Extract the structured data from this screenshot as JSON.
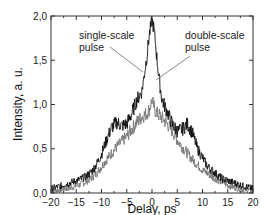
{
  "chart_data": {
    "type": "line",
    "title": "",
    "xlabel": "Delay, ps",
    "ylabel": "Intensity, a. u.",
    "xlim": [
      -20,
      20
    ],
    "ylim": [
      0,
      2.0
    ],
    "grid": false,
    "legend": null,
    "x_ticks": [
      -20,
      -15,
      -10,
      -5,
      0,
      5,
      10,
      15,
      20
    ],
    "x_tick_labels": [
      "-20",
      "-15",
      "-10",
      "-5",
      "0",
      "5",
      "10",
      "15",
      "20"
    ],
    "y_ticks": [
      0,
      0.5,
      1.0,
      1.5,
      2.0
    ],
    "y_tick_labels": [
      "0,0",
      "0,5",
      "1,0",
      "1,5",
      "2,0"
    ],
    "annotations": [
      {
        "text_lines": [
          "single-scale",
          "pulse"
        ],
        "points_to": "single-scale pulse curve near x=-1, y=0.95"
      },
      {
        "text_lines": [
          "double-scale",
          "pulse"
        ],
        "points_to": "double-scale pulse curve near x=1, y=0.85"
      }
    ],
    "series": [
      {
        "name": "single-scale pulse",
        "color": "#111111",
        "x": [
          -20,
          -18,
          -16,
          -15,
          -14,
          -13,
          -12,
          -11,
          -10,
          -9,
          -8,
          -7,
          -6,
          -5,
          -4,
          -3,
          -2,
          -1.5,
          -1,
          -0.5,
          0,
          0.3,
          0.6,
          1,
          1.5,
          2,
          3,
          4,
          5,
          6,
          7,
          8,
          9,
          10,
          11,
          12,
          13,
          14,
          15,
          16,
          18,
          20
        ],
        "y": [
          0.05,
          0.08,
          0.12,
          0.14,
          0.16,
          0.19,
          0.24,
          0.32,
          0.44,
          0.6,
          0.74,
          0.8,
          0.76,
          0.78,
          0.9,
          1.05,
          1.15,
          1.35,
          1.55,
          1.8,
          1.95,
          1.88,
          1.75,
          1.5,
          1.25,
          1.05,
          0.92,
          0.78,
          0.7,
          0.72,
          0.78,
          0.68,
          0.5,
          0.4,
          0.3,
          0.25,
          0.2,
          0.16,
          0.14,
          0.12,
          0.08,
          0.05
        ]
      },
      {
        "name": "double-scale pulse",
        "color": "#777777",
        "x": [
          -20,
          -18,
          -16,
          -14,
          -13,
          -12,
          -11,
          -10,
          -9,
          -8,
          -7,
          -6,
          -5,
          -4,
          -3,
          -2,
          -1,
          -0.5,
          0,
          0.5,
          1,
          2,
          3,
          4,
          5,
          6,
          7,
          8,
          9,
          10,
          11,
          12,
          13,
          14,
          15,
          16,
          18,
          20
        ],
        "y": [
          0.02,
          0.04,
          0.06,
          0.1,
          0.13,
          0.17,
          0.22,
          0.3,
          0.38,
          0.45,
          0.52,
          0.58,
          0.64,
          0.72,
          0.8,
          0.86,
          0.9,
          0.95,
          1.05,
          0.95,
          0.9,
          0.85,
          0.78,
          0.7,
          0.6,
          0.52,
          0.45,
          0.38,
          0.32,
          0.26,
          0.22,
          0.18,
          0.15,
          0.12,
          0.09,
          0.07,
          0.04,
          0.02
        ]
      }
    ]
  }
}
